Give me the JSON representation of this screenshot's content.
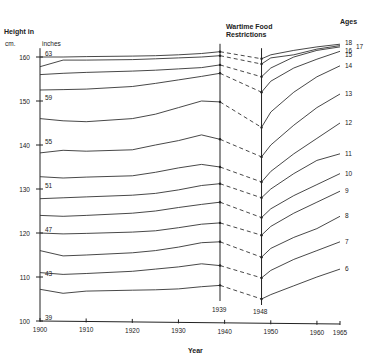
{
  "chart_data": {
    "type": "line",
    "title": "",
    "xlabel": "Year",
    "ylabel": "Height in cm. / inches",
    "ylabel_cm": "cm.",
    "ylabel_inches": "inches",
    "ylabel_title": "Height in",
    "xlim": [
      1900,
      1965
    ],
    "ylim": [
      100,
      162
    ],
    "x_ticks": [
      1900,
      1910,
      1920,
      1930,
      1940,
      1950,
      1960,
      1965
    ],
    "y_ticks_cm": [
      100,
      110,
      120,
      130,
      140,
      150,
      160
    ],
    "y_ticks_inches": [
      39,
      43,
      47,
      51,
      55,
      59,
      63
    ],
    "legend_title": "Ages",
    "annotation": {
      "text_line1": "Wartime Food",
      "text_line2": "Restrictions",
      "start_year": "1939",
      "end_year": "1948",
      "note": "Dashed segments between 1939 and 1948"
    },
    "grid": false,
    "x": [
      1900,
      1905,
      1910,
      1920,
      1925,
      1930,
      1935,
      1939,
      1948,
      1950,
      1955,
      1960,
      1965
    ],
    "series": [
      {
        "name": "6",
        "values": [
          107.2,
          106.3,
          106.8,
          107.0,
          107.1,
          107.3,
          107.8,
          108.1,
          105.0,
          106.0,
          108.0,
          110.0,
          111.8
        ]
      },
      {
        "name": "7",
        "values": [
          111.0,
          110.6,
          110.8,
          111.3,
          111.8,
          112.3,
          113.0,
          112.6,
          109.8,
          111.5,
          114.0,
          116.0,
          118.0
        ]
      },
      {
        "name": "8",
        "values": [
          116.0,
          114.8,
          115.0,
          115.5,
          116.0,
          116.8,
          117.8,
          118.0,
          114.5,
          116.5,
          119.0,
          121.0,
          123.8
        ]
      },
      {
        "name": "9",
        "values": [
          120.0,
          119.8,
          119.9,
          120.2,
          120.5,
          121.2,
          122.0,
          122.3,
          119.5,
          121.5,
          124.5,
          127.0,
          129.5
        ]
      },
      {
        "name": "10",
        "values": [
          124.0,
          123.8,
          124.0,
          124.5,
          125.0,
          125.8,
          126.5,
          127.0,
          123.5,
          125.5,
          128.5,
          131.0,
          133.5
        ]
      },
      {
        "name": "11",
        "values": [
          127.8,
          128.0,
          128.2,
          128.6,
          129.0,
          129.8,
          130.8,
          131.2,
          128.0,
          130.0,
          133.5,
          136.5,
          138.0
        ]
      },
      {
        "name": "12",
        "values": [
          132.8,
          132.5,
          132.7,
          133.0,
          133.8,
          134.8,
          135.6,
          135.0,
          131.6,
          134.0,
          138.0,
          141.5,
          145.0
        ]
      },
      {
        "name": "13",
        "values": [
          138.2,
          138.8,
          138.6,
          138.9,
          140.0,
          141.0,
          142.3,
          141.3,
          137.3,
          140.0,
          144.5,
          148.5,
          151.6
        ]
      },
      {
        "name": "14",
        "values": [
          146.0,
          145.5,
          145.3,
          146.0,
          147.0,
          148.5,
          150.0,
          149.8,
          144.0,
          147.5,
          152.0,
          155.5,
          158.0
        ]
      },
      {
        "name": "15",
        "values": [
          152.5,
          152.6,
          152.7,
          153.3,
          154.0,
          154.8,
          155.6,
          156.3,
          152.0,
          154.5,
          157.5,
          159.5,
          161.3
        ]
      },
      {
        "name": "16",
        "values": [
          156.0,
          156.3,
          156.5,
          156.8,
          157.0,
          157.3,
          157.6,
          158.2,
          155.5,
          157.5,
          160.0,
          161.5,
          162.3
        ]
      },
      {
        "name": "17",
        "values": [
          157.8,
          159.3,
          159.3,
          159.4,
          159.6,
          159.8,
          160.0,
          160.3,
          158.4,
          159.8,
          160.5,
          161.8,
          162.6
        ]
      },
      {
        "name": "18",
        "values": [
          160.0,
          160.0,
          160.1,
          160.2,
          160.3,
          160.5,
          160.8,
          161.2,
          159.6,
          160.5,
          161.5,
          162.3,
          162.9
        ]
      }
    ]
  }
}
